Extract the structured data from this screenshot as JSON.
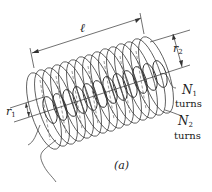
{
  "figure": {
    "caption": "(a)",
    "labels": {
      "length": "ℓ",
      "r1": "r",
      "r1_sub": "1",
      "r2": "r",
      "r2_sub": "2",
      "n1": "N",
      "n1_sub": "1",
      "n1_unit": "turns",
      "n2": "N",
      "n2_sub": "2",
      "n2_unit": "turns"
    },
    "colors": {
      "stroke": "#333333",
      "background": "#ffffff"
    }
  }
}
